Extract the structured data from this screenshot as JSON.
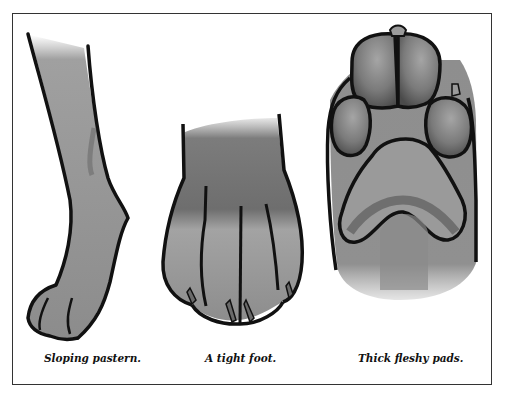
{
  "figure": {
    "panels": [
      {
        "id": "pastern",
        "subject": "side view of dog foreleg and paw",
        "caption": "Sloping pastern."
      },
      {
        "id": "tight-foot",
        "subject": "front view of compact dog paw",
        "caption": "A tight foot."
      },
      {
        "id": "pads",
        "subject": "underside of dog paw showing pads",
        "caption": "Thick fleshy pads."
      }
    ]
  },
  "colors": {
    "outline": "#111111",
    "fill_light": "#9a9a9a",
    "fill_mid": "#7e7e7e",
    "fill_dark": "#555555",
    "border": "#333333"
  }
}
